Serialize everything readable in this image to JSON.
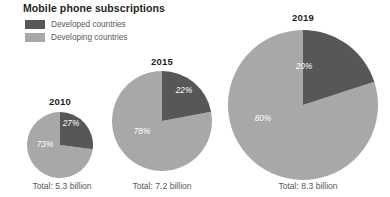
{
  "chart_data": {
    "type": "pie",
    "title": "Mobile phone subscriptions",
    "xlabel": "",
    "ylabel": "",
    "legend_position": "top-left",
    "grid": false,
    "legend": [
      {
        "name": "Developed countries",
        "color": "#575757"
      },
      {
        "name": "Developing countries",
        "color": "#a8a8a8"
      }
    ],
    "series": [
      {
        "name": "Developed countries",
        "values": [
          27,
          22,
          20
        ]
      },
      {
        "name": "Developing countries",
        "values": [
          73,
          78,
          80
        ]
      }
    ],
    "categories": [
      "2010",
      "2015",
      "2019"
    ],
    "charts": [
      {
        "year": "2010",
        "total_label": "Total: 5.3 billion",
        "total_value": 5.3,
        "unit": "billion",
        "slices": [
          {
            "name": "Developed countries",
            "value": 27,
            "label": "27%",
            "color": "#575757"
          },
          {
            "name": "Developing countries",
            "value": 73,
            "label": "73%",
            "color": "#a8a8a8"
          }
        ]
      },
      {
        "year": "2015",
        "total_label": "Total: 7.2 billion",
        "total_value": 7.2,
        "unit": "billion",
        "slices": [
          {
            "name": "Developed countries",
            "value": 22,
            "label": "22%",
            "color": "#575757"
          },
          {
            "name": "Developing countries",
            "value": 78,
            "label": "78%",
            "color": "#a8a8a8"
          }
        ]
      },
      {
        "year": "2019",
        "total_label": "Total: 8.3 billion",
        "total_value": 8.3,
        "unit": "billion",
        "slices": [
          {
            "name": "Developed countries",
            "value": 20,
            "label": "20%",
            "color": "#575757"
          },
          {
            "name": "Developing countries",
            "value": 80,
            "label": "80%",
            "color": "#a8a8a8"
          }
        ]
      }
    ],
    "colors": {
      "developed": "#575757",
      "developing": "#a8a8a8",
      "background": "#ffffff",
      "title_text": "#231f20",
      "body_text": "#58595b",
      "slice_label_text": "#ffffff"
    }
  }
}
